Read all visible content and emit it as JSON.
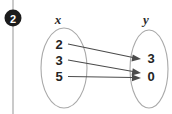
{
  "badge": {
    "number": "2"
  },
  "diagram": {
    "type": "mapping-diagram",
    "domain_label": "x",
    "range_label": "y",
    "domain_elements": [
      "2",
      "3",
      "5"
    ],
    "range_elements": [
      "3",
      "0"
    ],
    "mappings": [
      {
        "from": "2",
        "to": "3"
      },
      {
        "from": "3",
        "to": "0"
      },
      {
        "from": "5",
        "to": "0"
      }
    ],
    "colors": {
      "oval_stroke": "#a9a9a9",
      "arrow": "#4b4b4b",
      "text": "#242424",
      "badge_fill": "#1c1c1c",
      "badge_text": "#ffffff",
      "rule": "#b4b4b4",
      "background": "#ffffff"
    }
  }
}
